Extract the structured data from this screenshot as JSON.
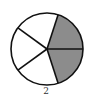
{
  "figure": {
    "type": "fraction-circle",
    "total_parts": 5,
    "shaded_parts": 2,
    "shaded_color": "#8c8c8c",
    "unshaded_color": "#ffffff",
    "stroke_color": "#111111",
    "label": "2"
  }
}
